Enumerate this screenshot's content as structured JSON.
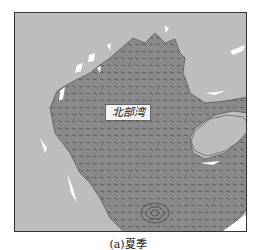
{
  "figure": {
    "caption": "(a)夏季",
    "region_label": "北部湾",
    "colors": {
      "land": "#bdbdbd",
      "sea": "#8a8a8a",
      "coast_highlight": "#ffffff",
      "vectors": "#333333",
      "frame": "#333333"
    }
  }
}
